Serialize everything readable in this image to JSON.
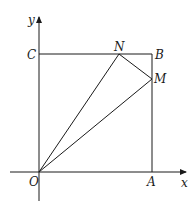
{
  "diagram": {
    "type": "coordinate-geometry",
    "axes": {
      "x_label": "x",
      "y_label": "y",
      "origin_label": "O"
    },
    "points": {
      "O": {
        "label": "O",
        "px": [
          39,
          172
        ]
      },
      "A": {
        "label": "A",
        "px": [
          152,
          172
        ]
      },
      "B": {
        "label": "B",
        "px": [
          152,
          54
        ]
      },
      "C": {
        "label": "C",
        "px": [
          39,
          54
        ]
      },
      "N": {
        "label": "N",
        "px": [
          119,
          54
        ]
      },
      "M": {
        "label": "M",
        "px": [
          152,
          79
        ]
      }
    },
    "segments": [
      [
        "C",
        "B"
      ],
      [
        "B",
        "A"
      ],
      [
        "O",
        "N"
      ],
      [
        "O",
        "M"
      ],
      [
        "N",
        "M"
      ]
    ],
    "stroke_color": "#1a1a1a"
  }
}
